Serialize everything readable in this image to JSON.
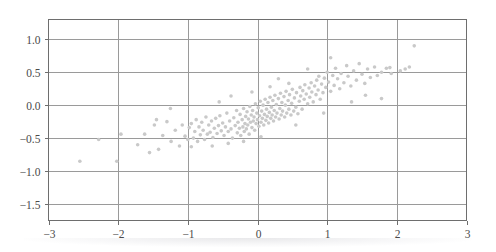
{
  "chart_data": {
    "type": "scatter",
    "title": "",
    "xlabel": "",
    "ylabel": "",
    "xlim": [
      -3,
      3
    ],
    "ylim": [
      -1.75,
      1.3
    ],
    "grid": true,
    "legend": null,
    "marker": {
      "shape": "circle",
      "color": "#c9c9c9",
      "size_px": 3.6
    },
    "xticks": [
      -3,
      -2,
      -1,
      0,
      1,
      2,
      3
    ],
    "xtick_labels": [
      "−3",
      "−2",
      "−1",
      "0",
      "1",
      "2",
      "3"
    ],
    "yticks": [
      1.0,
      0.5,
      0.0,
      -0.5,
      -1.0,
      -1.5
    ],
    "ytick_labels": [
      "1.0",
      "0.5",
      "0.0",
      "−0.5",
      "−1.0",
      "−1.5"
    ],
    "n_points": 180,
    "points": [
      [
        -2.55,
        -0.85
      ],
      [
        -2.28,
        -0.52
      ],
      [
        -2.02,
        -0.85
      ],
      [
        -1.96,
        -0.44
      ],
      [
        -1.72,
        -0.6
      ],
      [
        -1.62,
        -0.44
      ],
      [
        -1.55,
        -0.72
      ],
      [
        -1.48,
        -0.3
      ],
      [
        -1.42,
        -0.67
      ],
      [
        -1.36,
        -0.46
      ],
      [
        -1.3,
        -0.25
      ],
      [
        -1.24,
        -0.55
      ],
      [
        -1.18,
        -0.38
      ],
      [
        -1.12,
        -0.62
      ],
      [
        -1.08,
        -0.3
      ],
      [
        -1.04,
        -0.47
      ],
      [
        -1.0,
        -0.52
      ],
      [
        -0.98,
        -0.34
      ],
      [
        -0.95,
        -0.28
      ],
      [
        -0.92,
        -0.5
      ],
      [
        -0.9,
        -0.4
      ],
      [
        -0.88,
        -0.22
      ],
      [
        -0.86,
        -0.55
      ],
      [
        -0.84,
        -0.33
      ],
      [
        -0.82,
        -0.45
      ],
      [
        -0.8,
        -0.26
      ],
      [
        -0.78,
        -0.38
      ],
      [
        -0.76,
        -0.52
      ],
      [
        -0.74,
        -0.18
      ],
      [
        -0.72,
        -0.44
      ],
      [
        -0.7,
        -0.3
      ],
      [
        -0.68,
        -0.41
      ],
      [
        -0.66,
        -0.24
      ],
      [
        -0.64,
        -0.49
      ],
      [
        -0.62,
        -0.35
      ],
      [
        -0.6,
        -0.2
      ],
      [
        -0.58,
        -0.43
      ],
      [
        -0.56,
        -0.31
      ],
      [
        -0.54,
        -0.16
      ],
      [
        -0.52,
        -0.39
      ],
      [
        -0.5,
        -0.27
      ],
      [
        -0.48,
        -0.46
      ],
      [
        -0.46,
        -0.33
      ],
      [
        -0.44,
        -0.12
      ],
      [
        -0.42,
        -0.4
      ],
      [
        -0.4,
        -0.24
      ],
      [
        -0.38,
        -0.36
      ],
      [
        -0.36,
        -0.5
      ],
      [
        -0.34,
        -0.19
      ],
      [
        -0.32,
        -0.31
      ],
      [
        -0.3,
        -0.08
      ],
      [
        -0.29,
        -0.42
      ],
      [
        -0.28,
        -0.26
      ],
      [
        -0.26,
        -0.35
      ],
      [
        -0.25,
        -0.14
      ],
      [
        -0.24,
        -0.46
      ],
      [
        -0.22,
        -0.22
      ],
      [
        -0.21,
        -0.33
      ],
      [
        -0.2,
        -0.05
      ],
      [
        -0.19,
        -0.4
      ],
      [
        -0.18,
        -0.28
      ],
      [
        -0.17,
        -0.17
      ],
      [
        -0.16,
        -0.36
      ],
      [
        -0.15,
        -0.1
      ],
      [
        -0.14,
        -0.3
      ],
      [
        -0.13,
        -0.21
      ],
      [
        -0.12,
        -0.44
      ],
      [
        -0.11,
        -0.02
      ],
      [
        -0.1,
        -0.26
      ],
      [
        -0.09,
        -0.15
      ],
      [
        -0.08,
        -0.34
      ],
      [
        -0.07,
        -0.08
      ],
      [
        -0.06,
        -0.24
      ],
      [
        -0.05,
        -0.18
      ],
      [
        -0.04,
        -0.38
      ],
      [
        -0.03,
        0.02
      ],
      [
        -0.02,
        -0.28
      ],
      [
        -0.01,
        -0.12
      ],
      [
        0.0,
        -0.22
      ],
      [
        0.01,
        -0.04
      ],
      [
        0.02,
        -0.32
      ],
      [
        0.03,
        -0.16
      ],
      [
        0.04,
        0.06
      ],
      [
        0.05,
        -0.26
      ],
      [
        0.06,
        -0.09
      ],
      [
        0.07,
        -0.2
      ],
      [
        0.08,
        0.0
      ],
      [
        0.09,
        -0.3
      ],
      [
        0.1,
        -0.14
      ],
      [
        0.11,
        0.09
      ],
      [
        0.12,
        -0.23
      ],
      [
        0.13,
        -0.06
      ],
      [
        0.14,
        -0.17
      ],
      [
        0.15,
        0.04
      ],
      [
        0.16,
        -0.27
      ],
      [
        0.17,
        -0.11
      ],
      [
        0.18,
        0.12
      ],
      [
        0.19,
        -0.2
      ],
      [
        0.2,
        -0.03
      ],
      [
        0.21,
        -0.15
      ],
      [
        0.22,
        0.07
      ],
      [
        0.23,
        -0.24
      ],
      [
        0.24,
        -0.08
      ],
      [
        0.25,
        0.15
      ],
      [
        0.26,
        -0.18
      ],
      [
        0.27,
        0.01
      ],
      [
        0.28,
        -0.12
      ],
      [
        0.3,
        0.1
      ],
      [
        0.31,
        -0.21
      ],
      [
        0.32,
        -0.05
      ],
      [
        0.33,
        0.18
      ],
      [
        0.34,
        -0.15
      ],
      [
        0.35,
        0.04
      ],
      [
        0.36,
        -0.09
      ],
      [
        0.38,
        0.13
      ],
      [
        0.39,
        -0.18
      ],
      [
        0.4,
        0.0
      ],
      [
        0.41,
        0.21
      ],
      [
        0.42,
        -0.12
      ],
      [
        0.44,
        0.07
      ],
      [
        0.45,
        -0.06
      ],
      [
        0.46,
        0.16
      ],
      [
        0.48,
        -0.15
      ],
      [
        0.49,
        0.03
      ],
      [
        0.5,
        0.24
      ],
      [
        0.52,
        -0.09
      ],
      [
        0.53,
        0.11
      ],
      [
        0.55,
        -0.03
      ],
      [
        0.56,
        0.19
      ],
      [
        0.58,
        -0.13
      ],
      [
        0.6,
        0.06
      ],
      [
        0.61,
        0.27
      ],
      [
        0.62,
        0.14
      ],
      [
        0.64,
        -0.06
      ],
      [
        0.65,
        0.22
      ],
      [
        0.67,
        0.09
      ],
      [
        0.68,
        0.31
      ],
      [
        0.7,
        0.17
      ],
      [
        0.72,
        0.02
      ],
      [
        0.74,
        0.26
      ],
      [
        0.75,
        0.12
      ],
      [
        0.77,
        0.34
      ],
      [
        0.78,
        0.2
      ],
      [
        0.8,
        0.05
      ],
      [
        0.82,
        0.29
      ],
      [
        0.84,
        0.16
      ],
      [
        0.85,
        0.38
      ],
      [
        0.87,
        0.23
      ],
      [
        0.88,
        0.44
      ],
      [
        0.9,
        0.09
      ],
      [
        0.92,
        0.32
      ],
      [
        0.94,
        0.19
      ],
      [
        0.96,
        0.41
      ],
      [
        0.98,
        0.27
      ],
      [
        1.0,
        0.5
      ],
      [
        1.02,
        0.35
      ],
      [
        1.05,
        0.21
      ],
      [
        1.08,
        0.45
      ],
      [
        1.1,
        0.3
      ],
      [
        1.12,
        0.56
      ],
      [
        1.15,
        0.4
      ],
      [
        1.18,
        0.25
      ],
      [
        1.2,
        0.48
      ],
      [
        1.24,
        0.34
      ],
      [
        1.28,
        0.6
      ],
      [
        1.3,
        0.44
      ],
      [
        1.34,
        0.29
      ],
      [
        1.38,
        0.52
      ],
      [
        1.42,
        0.38
      ],
      [
        1.46,
        0.63
      ],
      [
        1.5,
        0.47
      ],
      [
        1.54,
        0.33
      ],
      [
        1.58,
        0.55
      ],
      [
        1.62,
        0.42
      ],
      [
        1.68,
        0.58
      ],
      [
        1.72,
        0.45
      ],
      [
        1.78,
        0.5
      ],
      [
        1.85,
        0.56
      ],
      [
        1.92,
        0.48
      ],
      [
        2.05,
        0.52
      ],
      [
        2.18,
        0.58
      ],
      [
        2.25,
        0.9
      ],
      [
        1.05,
        0.72
      ],
      [
        0.72,
        0.55
      ],
      [
        0.55,
        -0.3
      ],
      [
        1.35,
        0.05
      ],
      [
        1.55,
        0.15
      ],
      [
        0.3,
        0.4
      ],
      [
        -0.55,
        0.05
      ],
      [
        -1.25,
        -0.05
      ],
      [
        0.95,
        -0.12
      ],
      [
        1.78,
        0.1
      ],
      [
        -0.08,
        0.2
      ],
      [
        0.45,
        0.33
      ],
      [
        -0.38,
        0.14
      ],
      [
        0.18,
        0.28
      ],
      [
        -0.65,
        -0.62
      ],
      [
        -0.42,
        -0.58
      ],
      [
        -0.2,
        -0.55
      ],
      [
        0.05,
        -0.48
      ],
      [
        -0.95,
        -0.63
      ],
      [
        -1.45,
        -0.22
      ],
      [
        2.12,
        0.55
      ],
      [
        1.9,
        0.57
      ]
    ]
  }
}
